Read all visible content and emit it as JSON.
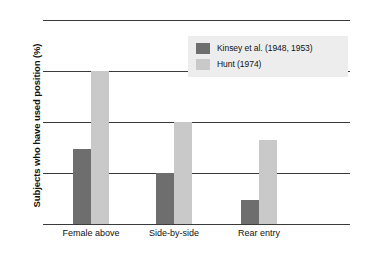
{
  "chart_data": {
    "type": "bar",
    "title": "",
    "xlabel": "",
    "ylabel": "Subjects who have used position (%)",
    "categories": [
      "Female above",
      "Side-by-side",
      "Rear entry"
    ],
    "series": [
      {
        "name": "Kinsey et al. (1948, 1953)",
        "color": "#6e6e6e",
        "values": [
          37,
          25,
          12
        ]
      },
      {
        "name": "Hunt (1974)",
        "color": "#c9c9c9",
        "values": [
          75,
          50,
          41
        ]
      }
    ],
    "ylim": [
      0,
      100
    ],
    "yticks": [
      0,
      25,
      50,
      75,
      100
    ],
    "ytick_labels": [
      "0",
      "25",
      "50",
      "75",
      "100"
    ],
    "grid": true,
    "legend_position": "upper-center",
    "legend_background": "#ededed",
    "plot_background": "#ffffff",
    "axis_color": "#3a3a3a"
  }
}
